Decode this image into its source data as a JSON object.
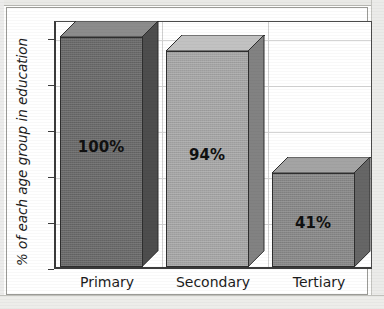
{
  "chart_data": {
    "type": "bar",
    "title": "",
    "subtitle": "",
    "xlabel": "",
    "ylabel": "% of each age group in education",
    "categories": [
      "Primary",
      "Secondary",
      "Tertiary"
    ],
    "values": [
      100,
      94,
      41
    ],
    "data_labels": [
      "100%",
      "94%",
      "41%"
    ],
    "ytick_labels": [
      "0",
      "20",
      "40",
      "60",
      "80",
      "100"
    ],
    "ytick_values": [
      0,
      20,
      40,
      60,
      80,
      100
    ],
    "ylim": [
      0,
      108
    ],
    "grid": "horizontal-and-category-separators",
    "legend": "none",
    "style": "3d-bars-grayscale-scanned",
    "series": [
      {
        "name": "% of each age group in education",
        "values": [
          100,
          94,
          41
        ]
      }
    ],
    "bar_colors": [
      "#6b6b6b",
      "#aaaaaa",
      "#8b8b8b"
    ],
    "bar_top_colors": [
      "#8c8c8c",
      "#c2c2c2",
      "#a4a4a4"
    ],
    "bar_side_colors": [
      "#4d4d4d",
      "#828282",
      "#666666"
    ],
    "axis_color": "#3b3b3b",
    "gridline_color": "#d4d4d4",
    "text_color": "#1c1c1c",
    "background_color": "#ffffff"
  }
}
